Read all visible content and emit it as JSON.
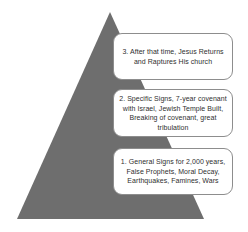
{
  "diagram": {
    "shape": {
      "name": "pyramid-triangle",
      "fill_color": "#6e6e6e",
      "apex": {
        "x": 110,
        "y": 12
      },
      "base_left": {
        "x": 17,
        "y": 219
      },
      "base_right": {
        "x": 204,
        "y": 219
      }
    },
    "box_style": {
      "background_color": "#ffffff",
      "border_color": "#8d8d8d",
      "text_color": "#2f2f2f"
    },
    "stages": [
      {
        "number": "3",
        "text": "3. After that time, Jesus Returns\nand Raptures His church"
      },
      {
        "number": "2",
        "text": "2. Specific Signs, 7-year covenant\nwith Israel, Jewish Temple Built,\nBreaking of covenant, great\ntribulation"
      },
      {
        "number": "1",
        "text": "1. General Signs for 2,000 years,\nFalse Prophets, Moral Decay,\nEarthquakes, Famines, Wars"
      }
    ]
  }
}
